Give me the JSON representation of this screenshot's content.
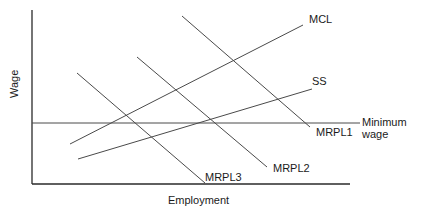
{
  "diagram": {
    "type": "economics-labor-market-diagram",
    "axes": {
      "x_label": "Employment",
      "y_label": "Wage"
    },
    "curves": {
      "mcl": {
        "label": "MCL"
      },
      "ss": {
        "label": "SS"
      },
      "mrpl1": {
        "label": "MRPL1"
      },
      "mrpl2": {
        "label": "MRPL2"
      },
      "mrpl3": {
        "label": "MRPL3"
      },
      "minimum_wage": {
        "label_line1": "Minimum",
        "label_line2": "wage"
      }
    },
    "line_color": "#4a4a4a",
    "axis_color": "#2a2a2a"
  }
}
